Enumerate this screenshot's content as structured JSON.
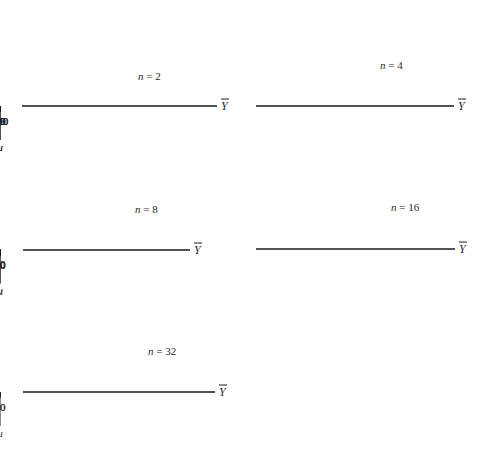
{
  "figure": {
    "x_symbol": "Y",
    "mu_symbol": "μ"
  },
  "chart_data": [
    {
      "type": "line",
      "title": "n = 2",
      "n": 2,
      "xlabel": "Ȳ",
      "xlim": [
        14,
        130
      ],
      "xticks_labeled": [
        20,
        40,
        60,
        80,
        100,
        120
      ],
      "xticks_minor": [
        30,
        50,
        70,
        90,
        110,
        130
      ],
      "mu": 64,
      "peak_x": 58.5,
      "shape": "right-skewed",
      "sd_left": 12,
      "sd_right": 17,
      "grid": false,
      "px": {
        "axis_y": 106,
        "x0": 22,
        "x1": 217,
        "val_a": 20,
        "px_a": 31,
        "val_b": 120,
        "px_b": 194,
        "peak_y": 24,
        "label_x": 138,
        "label_y": 80
      }
    },
    {
      "type": "line",
      "title": "n = 4",
      "n": 4,
      "xlabel": "Ȳ",
      "xlim": [
        32,
        110
      ],
      "xticks_labeled": [
        40,
        60,
        80,
        100
      ],
      "xticks_minor": [
        50,
        70,
        90
      ],
      "mu": 64,
      "peak_x": 62,
      "shape": "slightly right-skewed",
      "sd_left": 8.5,
      "sd_right": 11,
      "grid": false,
      "px": {
        "axis_y": 106,
        "x0": 256,
        "x1": 454,
        "val_a": 40,
        "px_a": 276,
        "val_b": 100,
        "px_b": 428,
        "peak_y": 23,
        "label_x": 380,
        "label_y": 69
      }
    },
    {
      "type": "line",
      "title": "n = 8",
      "n": 8,
      "xlabel": "Ȳ",
      "xlim": [
        32,
        97
      ],
      "xticks_labeled": [
        40,
        60,
        80
      ],
      "xticks_minor": [
        50,
        70,
        90
      ],
      "mu": 64,
      "peak_x": 62.7,
      "shape": "nearly symmetric",
      "sd_left": 6.2,
      "sd_right": 7.2,
      "grid": false,
      "px": {
        "axis_y": 250,
        "x0": 23,
        "x1": 190,
        "val_a": 40,
        "px_a": 43,
        "val_b": 80,
        "px_b": 146,
        "peak_y": 168,
        "label_x": 135,
        "label_y": 213
      }
    },
    {
      "type": "line",
      "title": "n = 16",
      "n": 16,
      "xlabel": "Ȳ",
      "xlim": [
        41,
        88
      ],
      "xticks_labeled": [
        60,
        80
      ],
      "xticks_minor": [
        50,
        70
      ],
      "mu": 64,
      "peak_x": 63.7,
      "shape": "nearly symmetric",
      "sd_left": 4.5,
      "sd_right": 5.0,
      "grid": false,
      "px": {
        "axis_y": 249,
        "x0": 256,
        "x1": 455,
        "val_a": 60,
        "px_a": 338,
        "val_b": 80,
        "px_b": 422,
        "peak_y": 167,
        "label_x": 391,
        "label_y": 211
      }
    },
    {
      "type": "line",
      "title": "n = 32",
      "n": 32,
      "xlabel": "Ȳ",
      "xlim": [
        49,
        81
      ],
      "xticks_labeled": [
        60,
        80
      ],
      "xticks_minor": [
        50,
        70
      ],
      "mu": 64,
      "peak_x": 63.9,
      "shape": "symmetric",
      "sd_left": 3.2,
      "sd_right": 3.4,
      "grid": false,
      "px": {
        "axis_y": 392,
        "x0": 23,
        "x1": 215,
        "val_a": 60,
        "px_a": 89,
        "val_b": 80,
        "px_b": 208,
        "peak_y": 308,
        "label_x": 148,
        "label_y": 355
      }
    }
  ]
}
